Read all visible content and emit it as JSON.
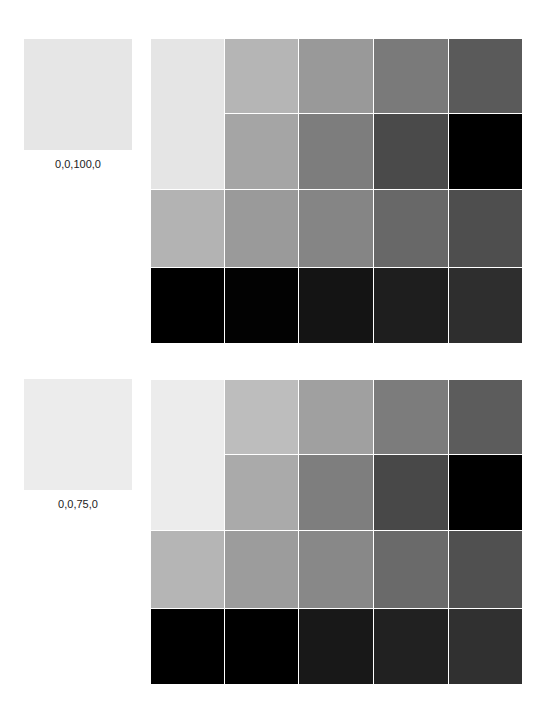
{
  "sections": [
    {
      "swatch": {
        "color": "#e6e6e6",
        "label": "0,0,100,0"
      },
      "grid": {
        "big_cell": "#e5e5e5",
        "rows": [
          [
            "#b5b5b5",
            "#999999",
            "#7a7a7a",
            "#5a5a5a"
          ],
          [
            "#a5a5a5",
            "#7d7d7d",
            "#4a4a4a",
            "#000000"
          ],
          [
            "#b3b3b3",
            "#9a9a9a",
            "#858585",
            "#686868",
            "#4e4e4e"
          ],
          [
            "#000000",
            "#020202",
            "#141414",
            "#1e1e1e",
            "#2e2e2e"
          ]
        ]
      }
    },
    {
      "swatch": {
        "color": "#ececec",
        "label": "0,0,75,0"
      },
      "grid": {
        "big_cell": "#ececec",
        "rows": [
          [
            "#bdbdbd",
            "#a0a0a0",
            "#7c7c7c",
            "#5c5c5c"
          ],
          [
            "#aaaaaa",
            "#7e7e7e",
            "#484848",
            "#000000"
          ],
          [
            "#b5b5b5",
            "#9c9c9c",
            "#888888",
            "#6a6a6a",
            "#505050"
          ],
          [
            "#000000",
            "#000000",
            "#181818",
            "#212121",
            "#303030"
          ]
        ]
      }
    }
  ]
}
